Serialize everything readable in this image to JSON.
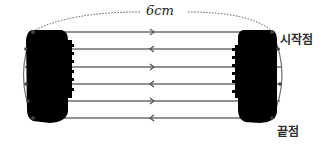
{
  "diagram": {
    "type": "coil-winding",
    "distance_label": "6cm",
    "start_label": "시작점",
    "end_label": "끝점",
    "wires": [
      {
        "index": 1,
        "y": 32,
        "direction": "right"
      },
      {
        "index": 2,
        "y": 49,
        "direction": "left"
      },
      {
        "index": 3,
        "y": 67,
        "direction": "right"
      },
      {
        "index": 4,
        "y": 84,
        "direction": "left"
      },
      {
        "index": 5,
        "y": 101,
        "direction": "right"
      },
      {
        "index": 6,
        "y": 118,
        "direction": "left"
      }
    ],
    "colors": {
      "wire": "#6e6e6e",
      "coil": "#000000",
      "text": "#1a1a1a"
    }
  }
}
